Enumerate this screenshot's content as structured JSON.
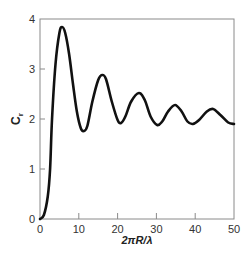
{
  "chart_data": {
    "type": "line",
    "title": "",
    "xlabel": "2πR/λ",
    "ylabel": "C",
    "ylabel_subscript": "r",
    "xlim": [
      0,
      50
    ],
    "ylim": [
      0,
      4
    ],
    "xticks": [
      0,
      10,
      20,
      30,
      40,
      50
    ],
    "yticks": [
      0,
      1,
      2,
      3,
      4
    ],
    "grid": false,
    "legend": null,
    "series": [
      {
        "name": "C_r",
        "color": "#111111",
        "x": [
          0,
          1,
          2,
          2.6,
          3.1,
          4,
          5,
          5.7,
          6.5,
          7.5,
          8.5,
          9.5,
          10.5,
          11.3,
          12.2,
          13.5,
          15,
          16,
          17,
          18.5,
          20,
          20.9,
          22,
          23.5,
          25.5,
          27,
          28.5,
          30.2,
          31.5,
          33,
          34.8,
          36.5,
          38,
          39.4,
          41,
          43,
          44.6,
          46.5,
          48.5,
          50
        ],
        "y": [
          0,
          0.08,
          0.45,
          1.0,
          2.0,
          3.1,
          3.72,
          3.84,
          3.72,
          3.3,
          2.7,
          2.15,
          1.82,
          1.76,
          1.86,
          2.35,
          2.78,
          2.88,
          2.8,
          2.35,
          1.98,
          1.92,
          2.05,
          2.35,
          2.52,
          2.38,
          2.05,
          1.88,
          1.95,
          2.15,
          2.28,
          2.15,
          1.95,
          1.9,
          1.98,
          2.15,
          2.2,
          2.08,
          1.93,
          1.9
        ]
      }
    ]
  }
}
